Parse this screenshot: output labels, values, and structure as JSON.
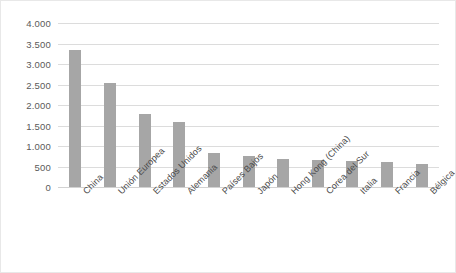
{
  "chart_data": {
    "type": "bar",
    "title": "",
    "subtitle": "",
    "xlabel": "",
    "ylabel": "",
    "categories": [
      "China",
      "Unión Europea",
      "Estados Unidos",
      "Alemania",
      "Países Bajos",
      "Japón",
      "Hong Kong (China)",
      "Corea del Sur",
      "Italia",
      "Francia",
      "Bélgica"
    ],
    "values": [
      3340,
      2540,
      1780,
      1590,
      830,
      755,
      680,
      670,
      630,
      615,
      560
    ],
    "ylim": [
      0,
      4000
    ],
    "ytick_values": [
      0,
      500,
      1000,
      1500,
      2000,
      2500,
      3000,
      3500,
      4000
    ],
    "ytick_labels": [
      "0",
      "500",
      "1.000",
      "1.500",
      "2.000",
      "2.500",
      "3.000",
      "3.500",
      "4.000"
    ],
    "grid": true,
    "legend": false,
    "legend_position": "none",
    "bar_color": "#a6a6a6",
    "gridline_color": "#dcdcdc",
    "plot_background": "#ffffff",
    "border_color": "#e8e8e8"
  }
}
